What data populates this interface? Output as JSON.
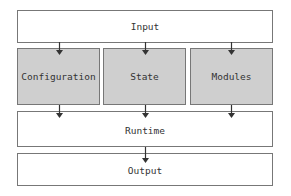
{
  "diagram": {
    "nodes": {
      "input": {
        "label": "Input"
      },
      "configuration": {
        "label": "Configuration"
      },
      "state": {
        "label": "State"
      },
      "modules": {
        "label": "Modules"
      },
      "runtime": {
        "label": "Runtime"
      },
      "output": {
        "label": "Output"
      }
    },
    "edges": [
      {
        "from": "input",
        "to": "configuration"
      },
      {
        "from": "input",
        "to": "state"
      },
      {
        "from": "input",
        "to": "modules"
      },
      {
        "from": "configuration",
        "to": "runtime"
      },
      {
        "from": "state",
        "to": "runtime"
      },
      {
        "from": "modules",
        "to": "runtime"
      },
      {
        "from": "runtime",
        "to": "output"
      }
    ],
    "colors": {
      "box_fill": "#ffffff",
      "module_fill": "#cfcfcf",
      "border": "#777777",
      "arrow": "#333333"
    }
  }
}
